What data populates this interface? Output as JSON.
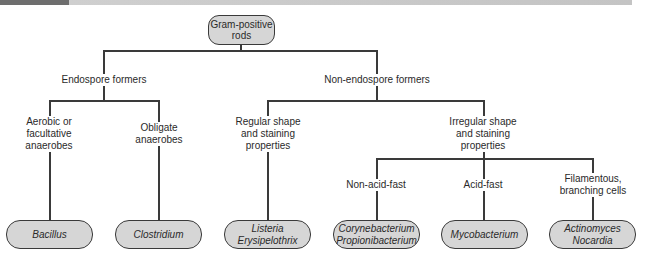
{
  "header": {
    "dark_block_color": "#6e6e6e",
    "bar_color": "#c8c8c8"
  },
  "diagram": {
    "root": {
      "lines": [
        "Gram-positive",
        "rods"
      ]
    },
    "branches": {
      "endospore": {
        "label": "Endospore formers",
        "children": {
          "aerobic": {
            "lines": [
              "Aerobic or",
              "facultative",
              "anaerobes"
            ],
            "leaf": [
              "Bacillus"
            ]
          },
          "obligate": {
            "lines": [
              "Obligate",
              "anaerobes"
            ],
            "leaf": [
              "Clostridium"
            ]
          }
        }
      },
      "non_endospore": {
        "label": "Non-endospore formers",
        "children": {
          "regular": {
            "lines": [
              "Regular shape",
              "and staining",
              "properties"
            ],
            "leaf": [
              "Listeria",
              "Erysipelothrix"
            ]
          },
          "irregular": {
            "lines": [
              "Irregular shape",
              "and staining",
              "properties"
            ],
            "children": {
              "non_acid_fast": {
                "lines": [
                  "Non-acid-fast"
                ],
                "leaf": [
                  "Corynebacterium",
                  "Propionibacterium"
                ]
              },
              "acid_fast": {
                "lines": [
                  "Acid-fast"
                ],
                "leaf": [
                  "Mycobacterium"
                ]
              },
              "filamentous": {
                "lines": [
                  "Filamentous,",
                  "branching cells"
                ],
                "leaf": [
                  "Actinomyces",
                  "Nocardia"
                ]
              }
            }
          }
        }
      }
    }
  },
  "colors": {
    "node_fill": "#d6d6d6",
    "line": "#3a3a3a"
  }
}
